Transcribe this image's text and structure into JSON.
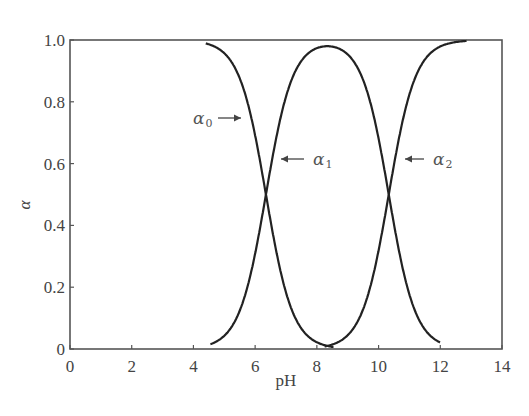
{
  "chart_data": {
    "type": "line",
    "title": "",
    "xlabel": "pH",
    "ylabel": "α",
    "xlim": [
      0,
      14
    ],
    "ylim": [
      0,
      1.0
    ],
    "grid": false,
    "legend": "none (inline curve labels with arrows)",
    "x_ticks": [
      0,
      2,
      4,
      6,
      8,
      10,
      12,
      14
    ],
    "x_tick_labels": [
      "0",
      "2",
      "4",
      "6",
      "8",
      "10",
      "12",
      "14"
    ],
    "y_ticks": [
      0,
      0.2,
      0.4,
      0.6,
      0.8,
      1.0
    ],
    "y_tick_labels": [
      "0",
      "0.2",
      "0.4",
      "0.6",
      "0.8",
      "1.0"
    ],
    "pKa1": 6.35,
    "pKa2": 10.33,
    "x": [
      4.4,
      5.0,
      5.5,
      6.0,
      6.35,
      6.7,
      7.0,
      7.5,
      8.0,
      8.35,
      8.7,
      9.0,
      9.5,
      10.0,
      10.33,
      10.7,
      11.0,
      11.5,
      12.0,
      12.8
    ],
    "series": [
      {
        "name": "α0",
        "label": "α",
        "subscript": "0",
        "values": [
          0.99,
          0.96,
          0.87,
          0.69,
          0.5,
          0.31,
          0.18,
          0.07,
          0.02,
          0.01,
          0.0,
          0.0,
          0.0,
          0.0,
          0.0,
          0.0,
          0.0,
          0.0,
          0.0,
          0.0
        ]
      },
      {
        "name": "α1",
        "label": "α",
        "subscript": "1",
        "values": [
          0.01,
          0.04,
          0.13,
          0.31,
          0.5,
          0.69,
          0.81,
          0.92,
          0.97,
          0.98,
          0.97,
          0.95,
          0.86,
          0.68,
          0.5,
          0.3,
          0.17,
          0.06,
          0.02,
          0.0
        ]
      },
      {
        "name": "α2",
        "label": "α",
        "subscript": "2",
        "values": [
          0.0,
          0.0,
          0.0,
          0.0,
          0.0,
          0.0,
          0.0,
          0.0,
          0.01,
          0.01,
          0.03,
          0.05,
          0.14,
          0.32,
          0.5,
          0.7,
          0.83,
          0.94,
          0.98,
          1.0
        ]
      }
    ],
    "annotations": [
      {
        "text": "α0",
        "arrow": "right",
        "target_x": 5.65,
        "target_y": 0.84
      },
      {
        "text": "α1",
        "arrow": "left",
        "target_x": 6.95,
        "target_y": 0.7
      },
      {
        "text": "α2",
        "arrow": "left",
        "target_x": 10.55,
        "target_y": 0.7
      }
    ]
  }
}
